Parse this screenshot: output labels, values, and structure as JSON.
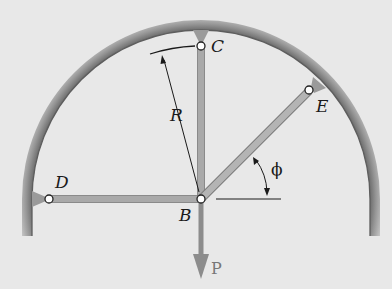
{
  "figure": {
    "type": "statics-structure-diagram",
    "labels": {
      "point_b": "B",
      "point_c": "C",
      "point_d": "D",
      "point_e": "E",
      "radius": "R",
      "angle": "ϕ",
      "load": "P"
    },
    "members": [
      {
        "name": "BC",
        "orientation": "vertical"
      },
      {
        "name": "BD",
        "orientation": "horizontal"
      },
      {
        "name": "BE",
        "orientation": "inclined at angle ϕ"
      }
    ],
    "colors": {
      "background": "#e8e8e8",
      "frame": "#8a8a8a",
      "member": "#a9a9a9",
      "load_arrow": "#8c8c8c",
      "ink": "#1a1a1a"
    }
  }
}
